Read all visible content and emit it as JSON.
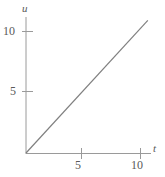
{
  "chart_data": {
    "type": "line",
    "title": "",
    "xlabel": "t",
    "ylabel": "u",
    "xlim": [
      0,
      11.8
    ],
    "ylim": [
      0,
      11.8
    ],
    "xticks": [
      5,
      10
    ],
    "yticks": [
      5,
      10
    ],
    "xtick_labels": [
      "5",
      "10"
    ],
    "ytick_labels": [
      "5",
      "10"
    ],
    "grid": false,
    "legend": null,
    "series": [
      {
        "name": "u = t",
        "x": [
          0,
          11.5
        ],
        "y": [
          0,
          11.5
        ],
        "color": "#808080"
      }
    ],
    "axis_color": "#9a9a9a",
    "line_color": "#808080",
    "background": "#ffffff"
  },
  "labels": {
    "y_tick_10": "10",
    "y_tick_5": "5",
    "x_tick_5": "5",
    "x_tick_10": "10",
    "axis_u": "u",
    "axis_t": "t"
  }
}
